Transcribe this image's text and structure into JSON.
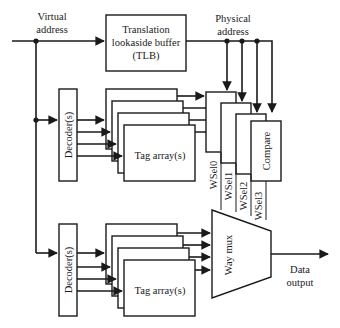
{
  "diagram": {
    "type": "set-associative cache block diagram",
    "labels": {
      "virtual_address": [
        "Virtual",
        "address"
      ],
      "physical_address": [
        "Physical",
        "address"
      ],
      "tlb": [
        "Translation",
        "lookaside buffer",
        "(TLB)"
      ],
      "decoder_top": "Decoder(s)",
      "decoder_bottom": "Decoder(s)",
      "tag_array_top": "Tag array(s)",
      "tag_array_bottom": "Tag array(s)",
      "compare": "Compare",
      "way_mux": "Way mux",
      "data_output": [
        "Data",
        "output"
      ],
      "way_selects": [
        "WSel0",
        "WSel1",
        "WSel2",
        "WSel3"
      ]
    },
    "colors": {
      "stroke": "#1a1a1a",
      "fill": "#ffffff"
    }
  }
}
